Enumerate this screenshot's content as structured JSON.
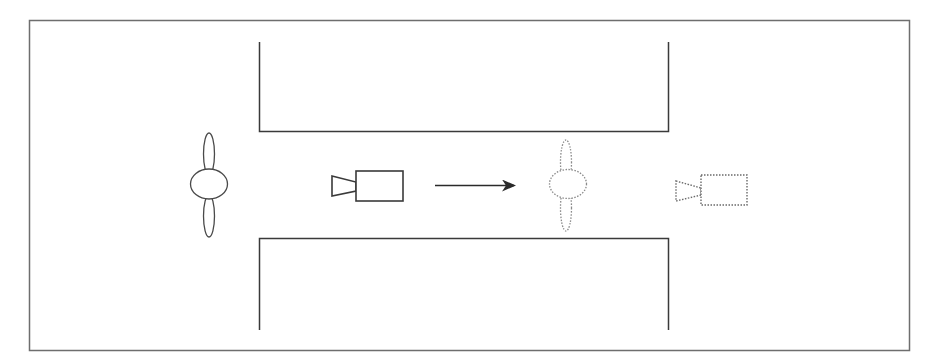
{
  "diagram": {
    "colors": {
      "background": "#ffffff",
      "frame": "#6e6e6e",
      "walls": "#3a3a3a",
      "solid_stroke": "#4a4a4a",
      "dotted_stroke": "#8a8a8a",
      "arrow": "#2a2a2a"
    },
    "elements": [
      {
        "id": "frame",
        "type": "border"
      },
      {
        "id": "wall-top",
        "type": "corridor-wall"
      },
      {
        "id": "wall-bottom",
        "type": "corridor-wall"
      },
      {
        "id": "person-start",
        "type": "person-top-view",
        "style": "solid"
      },
      {
        "id": "camera-start",
        "type": "camera-icon",
        "style": "solid"
      },
      {
        "id": "movement-arrow",
        "type": "arrow",
        "direction": "right"
      },
      {
        "id": "person-end",
        "type": "person-top-view",
        "style": "dotted"
      },
      {
        "id": "camera-end",
        "type": "camera-icon",
        "style": "dotted"
      }
    ]
  }
}
